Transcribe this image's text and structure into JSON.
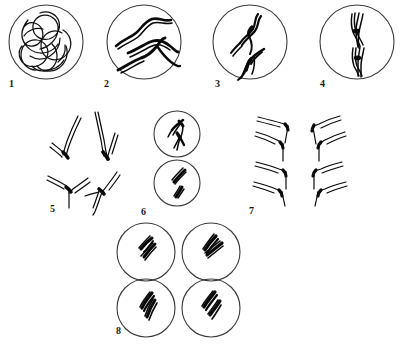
{
  "figure": {
    "background_color": "#ffffff",
    "line_color": "#0a0a0a",
    "outline_color": "#3a3a3a",
    "width": 407,
    "height": 345
  },
  "panels": [
    {
      "number": "1",
      "label_x": 9,
      "label_y": 87,
      "stage": "leptotene",
      "shape": "circle",
      "cx": 46,
      "cy": 42,
      "r": 37,
      "contents": "tangled thin chromatin threads",
      "chromosome_count": 2
    },
    {
      "number": "2",
      "label_x": 104,
      "label_y": 87,
      "stage": "zygotene",
      "shape": "circle",
      "cx": 144,
      "cy": 42,
      "r": 37,
      "contents": "thick wavy paired threads",
      "chromosome_count": 4
    },
    {
      "number": "3",
      "label_x": 215,
      "label_y": 87,
      "stage": "pachytene-diplotene",
      "shape": "circle",
      "cx": 250,
      "cy": 42,
      "r": 37,
      "contents": "two bivalents with chiasmata",
      "chromosome_count": 2
    },
    {
      "number": "4",
      "label_x": 320,
      "label_y": 87,
      "stage": "metaphase I",
      "shape": "circle",
      "cx": 357,
      "cy": 42,
      "r": 37,
      "contents": "two tetrads on metaphase plate",
      "chromosome_count": 2
    },
    {
      "number": "5",
      "label_x": 50,
      "label_y": 212,
      "stage": "anaphase I",
      "shape": "open",
      "cx": 85,
      "cy": 160,
      "r": 0,
      "contents": "four V-shaped chromosomes separating",
      "chromosome_count": 4
    },
    {
      "number": "6",
      "label_x": 141,
      "label_y": 215,
      "stage": "telophase I / prophase II",
      "shape": "two-circles",
      "cx": 176,
      "cy": 160,
      "r": 22,
      "contents": "two daughter cells each with two chromosomes",
      "chromosome_count": 2
    },
    {
      "number": "7",
      "label_x": 249,
      "label_y": 214,
      "stage": "anaphase II",
      "shape": "open",
      "cx": 300,
      "cy": 155,
      "r": 0,
      "contents": "four groups of V-shaped chromatids",
      "chromosome_count": 8
    },
    {
      "number": "8",
      "label_x": 116,
      "label_y": 334,
      "stage": "telophase II",
      "shape": "four-circles",
      "cx": 185,
      "cy": 285,
      "r": 30,
      "contents": "four haploid daughter cells",
      "chromosome_count": 2
    }
  ],
  "panel_labels": {
    "p1": "1",
    "p2": "2",
    "p3": "3",
    "p4": "4",
    "p5": "5",
    "p6": "6",
    "p7": "7",
    "p8": "8"
  }
}
